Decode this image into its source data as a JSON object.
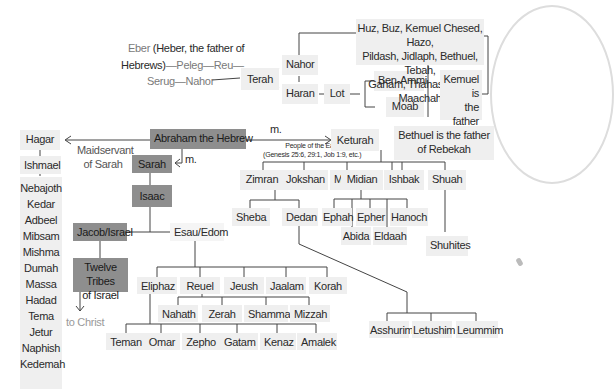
{
  "ancestry": {
    "line1_grey": "Eber",
    "line1_bold": "(Heber, the father of",
    "line2_bold": "Hebrews)",
    "line2_rest": "—Peleg—Reu—",
    "line3": "Serug—Nahor"
  },
  "nodes": {
    "terah": "Terah",
    "nahor": "Nahor",
    "haran": "Haran",
    "lot": "Lot",
    "ben_ammi": "Ben-Ammi",
    "moab": "Moab",
    "nahor_sons": [
      "Huz, Buz, Kemuel Chesed, Hazo,",
      "Pildash, Jidlaph, Bethuel, Tebah,",
      "Gaham, Thahash, and Maachah"
    ],
    "kemuel_note": [
      "Kemuel is",
      "the father",
      "of Aram"
    ],
    "bethuel_note": [
      "Bethuel is the father",
      "of Rebekah"
    ],
    "abraham": "Abraham the Hebrew",
    "hagar": "Hagar",
    "maidservant": [
      "Maidservant",
      "of Sarah"
    ],
    "married_label_1": "m.",
    "married_label_2": "m.",
    "sarah": "Sarah",
    "isaac": "Isaac",
    "jacob": "Jacob/Israel",
    "esau": "Esau/Edom",
    "twelve_tribes": [
      "Twelve Tribes",
      "of Israel"
    ],
    "to_christ": "to Christ",
    "ishmael": "Ishmael",
    "ishmael_sons": [
      "Nebajoth",
      "Kedar",
      "Adbeel",
      "Mibsam",
      "Mishma",
      "Dumah",
      "Massa",
      "Hadad",
      "Tema",
      "Jetur",
      "Naphish",
      "Kedemah"
    ],
    "keturah": "Keturah",
    "people_east": [
      "People of the East",
      "(Genesis 25:6, 29:1, Job 1:9, etc.)"
    ],
    "keturah_sons": [
      "Zimran",
      "Jokshan",
      "Medan",
      "Midian",
      "Ishbak",
      "Shuah"
    ],
    "jokshan_sons": [
      "Sheba",
      "Dedan"
    ],
    "midian_sons": [
      "Ephah",
      "Epher",
      "Hanoch",
      "Abida",
      "Eldaah"
    ],
    "shuhites": "Shuhites",
    "dedan_sons": [
      "Asshurim",
      "Letushim",
      "Leummim"
    ],
    "esau_sons": [
      "Eliphaz",
      "Reuel",
      "Jeush",
      "Jaalam",
      "Korah"
    ],
    "reuel_sons": [
      "Nahath",
      "Zerah",
      "Shammah",
      "Mizzah"
    ],
    "eliphaz_sons": [
      "Teman",
      "Omar",
      "Zepho",
      "Gatam",
      "Kenaz",
      "Amalek"
    ]
  },
  "colors": {
    "highlight_box": "#8e8e8e",
    "normal_box": "#efefef",
    "line": "#444444",
    "grey_text": "#7a7a7a"
  }
}
